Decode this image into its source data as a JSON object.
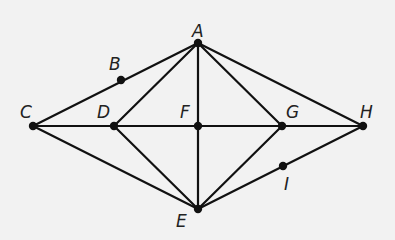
{
  "diagram": {
    "type": "geometry-graph",
    "points": [
      {
        "id": "A",
        "label": "A",
        "x": 198,
        "y": 43,
        "lx": 192,
        "ly": 37
      },
      {
        "id": "B",
        "label": "B",
        "x": 121,
        "y": 80,
        "lx": 109,
        "ly": 70
      },
      {
        "id": "C",
        "label": "C",
        "x": 33,
        "y": 126,
        "lx": 20,
        "ly": 118
      },
      {
        "id": "D",
        "label": "D",
        "x": 114,
        "y": 126,
        "lx": 97,
        "ly": 118
      },
      {
        "id": "F",
        "label": "F",
        "x": 198,
        "y": 126,
        "lx": 180,
        "ly": 118
      },
      {
        "id": "G",
        "label": "G",
        "x": 282,
        "y": 126,
        "lx": 286,
        "ly": 118
      },
      {
        "id": "H",
        "label": "H",
        "x": 363,
        "y": 126,
        "lx": 360,
        "ly": 118
      },
      {
        "id": "I",
        "label": "I",
        "x": 283,
        "y": 166,
        "lx": 284,
        "ly": 190
      },
      {
        "id": "E",
        "label": "E",
        "x": 198,
        "y": 209,
        "lx": 176,
        "ly": 227
      }
    ],
    "edges": [
      [
        "C",
        "A"
      ],
      [
        "D",
        "A"
      ],
      [
        "F",
        "A"
      ],
      [
        "G",
        "A"
      ],
      [
        "H",
        "A"
      ],
      [
        "C",
        "E"
      ],
      [
        "D",
        "E"
      ],
      [
        "F",
        "E"
      ],
      [
        "G",
        "E"
      ],
      [
        "H",
        "E"
      ],
      [
        "C",
        "H"
      ]
    ]
  }
}
